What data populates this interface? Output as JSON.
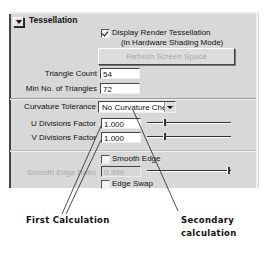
{
  "section": {
    "title": "Tessellation",
    "expanded": true
  },
  "display_render": {
    "label": "Display Render Tessellation",
    "sublabel": "(in Hardware Shading Mode)",
    "checked": true
  },
  "refresh_button": {
    "label": "Refresh Screen Space",
    "enabled": false
  },
  "fields": {
    "triangle_count": {
      "label": "Triangle Count",
      "value": "54"
    },
    "min_triangles": {
      "label": "Min No. of Triangles",
      "value": "72"
    },
    "curvature_tolerance": {
      "label": "Curvature Tolerance",
      "value": "No Curvature Check"
    },
    "u_divisions": {
      "label": "U Divisions Factor",
      "value": "1.000",
      "slider_pos": 0.2
    },
    "v_divisions": {
      "label": "V Divisions Factor",
      "value": "1.000",
      "slider_pos": 0.2
    },
    "smooth_edge_ratio": {
      "label": "Smooth Edge Ratio",
      "value": "0.999",
      "slider_pos": 0.98,
      "enabled": false
    }
  },
  "checkboxes": {
    "smooth_edge": {
      "label": "Smooth Edge",
      "checked": false
    },
    "edge_swap": {
      "label": "Edge Swap",
      "checked": false
    }
  },
  "annotations": {
    "first": "First Calculation",
    "secondary_line1": "Secondary",
    "secondary_line2": "calculation"
  }
}
